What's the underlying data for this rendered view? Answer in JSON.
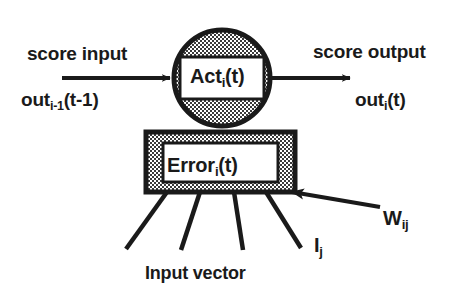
{
  "diagram": {
    "colors": {
      "ink": "#1a1a1a",
      "stipple_fill": "#8f8f8f",
      "inner_box_fill": "#ffffff",
      "background": "#ffffff"
    },
    "labels": {
      "score_input": "score input",
      "out_previous": {
        "base": "out",
        "sub": "i-1",
        "tail": "(t-1)"
      },
      "score_output": "score output",
      "out_current": {
        "base": "out",
        "sub": "i",
        "tail": "(t)"
      },
      "activation": {
        "base": "Act",
        "sub": "i",
        "tail": "(t)"
      },
      "error": {
        "base": "Error",
        "sub": "i",
        "tail": "(t)"
      },
      "weight": {
        "base": "W",
        "sub": "ij"
      },
      "input_component": {
        "base": "I",
        "sub": "j"
      },
      "input_vector": "Input vector"
    },
    "geometry": {
      "circle": {
        "cx": 222,
        "cy": 78,
        "r": 50
      },
      "act_box": {
        "x": 180,
        "y": 57,
        "w": 84,
        "h": 42
      },
      "error_outer": {
        "x": 146,
        "y": 132,
        "w": 149,
        "h": 60
      },
      "error_inner": {
        "x": 163,
        "y": 143,
        "w": 115,
        "h": 39
      },
      "input_arrow": {
        "x1": 62,
        "y1": 78,
        "x2": 176,
        "y2": 78
      },
      "output_arrow": {
        "x1": 272,
        "y1": 78,
        "x2": 356,
        "y2": 78
      },
      "weight_arrow": {
        "x1": 380,
        "y1": 207,
        "x2": 282,
        "y2": 190
      },
      "fan_lines": [
        {
          "x1": 167,
          "y1": 192,
          "x2": 126,
          "y2": 249
        },
        {
          "x1": 200,
          "y1": 192,
          "x2": 181,
          "y2": 250
        },
        {
          "x1": 234,
          "y1": 192,
          "x2": 242,
          "y2": 250
        },
        {
          "x1": 266,
          "y1": 192,
          "x2": 300,
          "y2": 248
        }
      ]
    }
  }
}
